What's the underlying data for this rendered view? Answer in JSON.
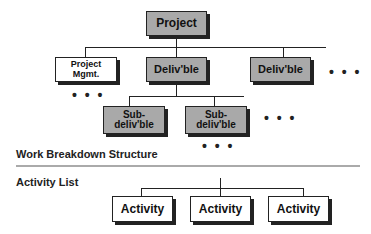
{
  "wbs": {
    "root": {
      "label": "Project"
    },
    "level1": [
      {
        "label": "Project Mgmt.",
        "line1": "Project",
        "line2": "Mgmt.",
        "style": "white"
      },
      {
        "label": "Deliv'ble",
        "style": "gray"
      },
      {
        "label": "Deliv'ble",
        "style": "gray"
      }
    ],
    "level2": [
      {
        "label": "Sub-deliv'ble",
        "line1": "Sub-",
        "line2": "deliv'ble",
        "style": "gray"
      },
      {
        "label": "Sub-deliv'ble",
        "line1": "Sub-",
        "line2": "deliv'ble",
        "style": "gray"
      }
    ],
    "ellipsis": "• • •",
    "section_label": "Work Breakdown Structure"
  },
  "activity_list": {
    "section_label": "Activity List",
    "items": [
      {
        "label": "Activity"
      },
      {
        "label": "Activity"
      },
      {
        "label": "Activity"
      }
    ]
  },
  "colors": {
    "box_gray": "#a9a9a9",
    "box_white": "#ffffff",
    "line": "#222222",
    "separator": "#aaaaaa"
  }
}
